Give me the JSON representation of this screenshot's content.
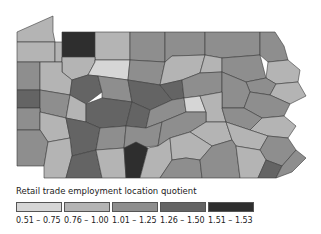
{
  "map": {
    "region": "Pennsylvania counties",
    "class_colors": [
      "#d6d6d6",
      "#b4b4b4",
      "#8e8e8e",
      "#646464",
      "#2e2e2e"
    ],
    "counties": [
      {
        "id": "erie",
        "cls": 1,
        "pts": "17,32 53,16 53,32 55,42 17,42"
      },
      {
        "id": "warren",
        "cls": 4,
        "pts": "62,32 95,32 95,57 62,57"
      },
      {
        "id": "mckean",
        "cls": 1,
        "pts": "95,32 130,32 130,60 95,60"
      },
      {
        "id": "potter",
        "cls": 2,
        "pts": "130,32 165,32 165,62 130,60"
      },
      {
        "id": "tioga",
        "cls": 2,
        "pts": "165,32 205,32 205,55 172,56 165,62"
      },
      {
        "id": "bradford",
        "cls": 2,
        "pts": "205,32 260,32 260,55 222,58 205,55"
      },
      {
        "id": "susquehanna",
        "cls": 2,
        "pts": "260,32 275,32 284,46 288,60 268,62 260,55"
      },
      {
        "id": "wayne",
        "cls": 1,
        "pts": "268,62 288,60 300,70 298,82 276,84 266,78"
      },
      {
        "id": "crawford",
        "cls": 1,
        "pts": "17,42 55,42 55,62 17,62"
      },
      {
        "id": "forest",
        "cls": 1,
        "pts": "55,42 62,42 62,57 62,62 55,62"
      },
      {
        "id": "elk",
        "cls": 1,
        "pts": "62,57 95,57 95,62 88,75 72,80 62,72"
      },
      {
        "id": "cameron",
        "cls": 0,
        "pts": "95,60 130,60 128,80 98,76 88,75 95,62"
      },
      {
        "id": "clinton",
        "cls": 2,
        "pts": "130,60 165,62 160,85 128,80"
      },
      {
        "id": "lycoming",
        "cls": 1,
        "pts": "165,62 172,56 205,55 200,73 182,80 160,85"
      },
      {
        "id": "sullivan",
        "cls": 1,
        "pts": "205,55 222,58 222,72 200,73"
      },
      {
        "id": "wyoming",
        "cls": 2,
        "pts": "222,58 260,55 266,78 246,82 222,72"
      },
      {
        "id": "lackawanna",
        "cls": 2,
        "pts": "246,82 266,78 276,84 270,95 250,92"
      },
      {
        "id": "pike",
        "cls": 1,
        "pts": "276,84 298,82 306,96 290,104 270,95"
      },
      {
        "id": "mercer",
        "cls": 2,
        "pts": "17,62 40,62 40,90 17,90"
      },
      {
        "id": "venango",
        "cls": 1,
        "pts": "40,62 62,62 62,72 72,80 70,95 40,90"
      },
      {
        "id": "jefferson",
        "cls": 3,
        "pts": "72,80 88,75 98,76 102,92 86,104 70,95"
      },
      {
        "id": "clearfield",
        "cls": 2,
        "pts": "98,76 128,80 132,102 102,98 102,92"
      },
      {
        "id": "centre",
        "cls": 3,
        "pts": "128,80 160,85 172,100 150,110 132,102"
      },
      {
        "id": "union",
        "cls": 3,
        "pts": "160,85 182,80 184,98 172,100"
      },
      {
        "id": "columbia",
        "cls": 2,
        "pts": "182,80 200,73 222,72 222,92 200,96 184,98"
      },
      {
        "id": "luzerne",
        "cls": 2,
        "pts": "222,72 246,82 250,92 244,108 222,108 222,92"
      },
      {
        "id": "monroe",
        "cls": 2,
        "pts": "250,92 270,95 290,104 284,116 262,118 244,108"
      },
      {
        "id": "lawrence",
        "cls": 3,
        "pts": "17,90 40,90 40,108 17,108"
      },
      {
        "id": "butler",
        "cls": 2,
        "pts": "40,90 70,95 66,118 40,112"
      },
      {
        "id": "armstrong",
        "cls": 1,
        "pts": "70,95 86,104 86,122 66,118"
      },
      {
        "id": "indiana",
        "cls": 3,
        "pts": "86,104 102,98 132,102 126,126 100,128 86,122"
      },
      {
        "id": "blair",
        "cls": 3,
        "pts": "132,102 150,110 146,128 126,126"
      },
      {
        "id": "mifflin",
        "cls": 2,
        "pts": "150,110 172,100 184,98 186,112 162,122 146,128"
      },
      {
        "id": "northumberland",
        "cls": 0,
        "pts": "184,98 200,96 206,112 186,112"
      },
      {
        "id": "schuylkill",
        "cls": 1,
        "pts": "200,96 222,92 222,108 226,122 206,122 206,112"
      },
      {
        "id": "carbon",
        "cls": 2,
        "pts": "222,108 244,108 262,118 250,130 226,122"
      },
      {
        "id": "northampton",
        "cls": 1,
        "pts": "262,118 284,116 296,126 288,138 268,136 250,130"
      },
      {
        "id": "beaver",
        "cls": 2,
        "pts": "17,108 40,108 40,112 40,130 17,130"
      },
      {
        "id": "allegheny",
        "cls": 1,
        "pts": "40,112 66,118 70,138 48,142 40,130"
      },
      {
        "id": "westmoreland",
        "cls": 3,
        "pts": "66,118 86,122 100,128 96,150 72,156 70,138"
      },
      {
        "id": "cambria",
        "cls": 2,
        "pts": "100,128 126,126 124,148 96,150"
      },
      {
        "id": "huntingdon",
        "cls": 2,
        "pts": "126,126 146,128 162,122 158,146 124,148"
      },
      {
        "id": "juniata",
        "cls": 2,
        "pts": "162,122 186,112 206,112 206,122 190,132 170,138 158,146"
      },
      {
        "id": "dauphin",
        "cls": 1,
        "pts": "206,122 226,122 232,140 212,146 190,132"
      },
      {
        "id": "lehigh",
        "cls": 1,
        "pts": "226,122 250,130 268,136 260,150 236,146 232,140"
      },
      {
        "id": "bucks",
        "cls": 2,
        "pts": "268,136 288,138 296,150 282,166 266,160 260,150"
      },
      {
        "id": "washington",
        "cls": 2,
        "pts": "17,130 40,130 48,142 44,166 17,166"
      },
      {
        "id": "fayette",
        "cls": 1,
        "pts": "48,142 70,138 72,156 66,178 44,178 44,166"
      },
      {
        "id": "somerset",
        "cls": 3,
        "pts": "72,156 96,150 102,178 66,178"
      },
      {
        "id": "bedford",
        "cls": 1,
        "pts": "96,150 124,148 126,178 102,178"
      },
      {
        "id": "fulton",
        "cls": 4,
        "pts": "124,148 136,142 148,148 140,178 126,178"
      },
      {
        "id": "franklin",
        "cls": 1,
        "pts": "148,148 158,146 170,138 172,160 160,178 140,178"
      },
      {
        "id": "cumberland",
        "cls": 1,
        "pts": "170,138 190,132 212,146 200,160 186,158 172,160"
      },
      {
        "id": "adams",
        "cls": 2,
        "pts": "172,160 186,158 200,160 202,178 160,178"
      },
      {
        "id": "york",
        "cls": 2,
        "pts": "200,160 212,146 232,140 236,146 240,178 202,178"
      },
      {
        "id": "lancaster",
        "cls": 1,
        "pts": "236,146 260,150 266,160 258,178 240,178"
      },
      {
        "id": "chester",
        "cls": 3,
        "pts": "266,160 282,166 276,178 258,178"
      },
      {
        "id": "delaware",
        "cls": 2,
        "pts": "282,166 296,150 306,158 292,172 276,178"
      }
    ]
  },
  "legend": {
    "title": "Retail trade employment location quotient",
    "items": [
      {
        "label": "0.51 – 0.75",
        "color": "#d6d6d6"
      },
      {
        "label": "0.76 – 1.00",
        "color": "#b4b4b4"
      },
      {
        "label": "1.01 – 1.25",
        "color": "#8e8e8e"
      },
      {
        "label": "1.26 – 1.50",
        "color": "#646464"
      },
      {
        "label": "1.51 – 1.53",
        "color": "#2e2e2e"
      }
    ]
  }
}
